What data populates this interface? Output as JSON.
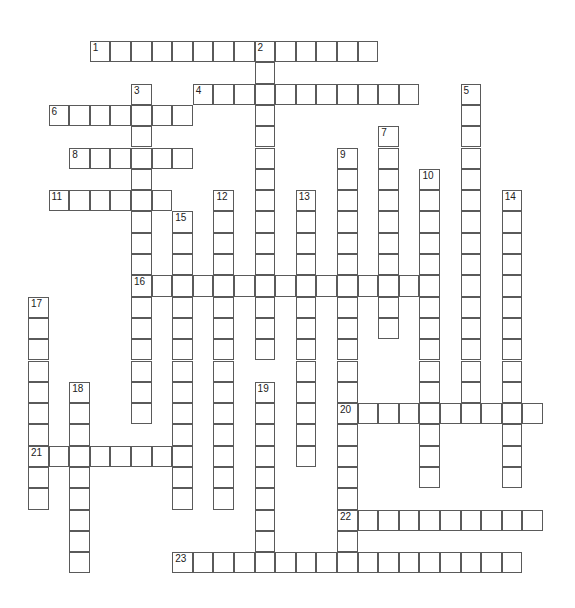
{
  "puzzle": {
    "grid_origin": {
      "x": 28,
      "y": 41
    },
    "cell_width": 20.6,
    "cell_height": 21.3,
    "line_color": "#5a5a5a",
    "words": [
      {
        "number": "1",
        "direction": "across",
        "row": 0,
        "col": 3,
        "length": 14
      },
      {
        "number": "2",
        "direction": "down",
        "row": 0,
        "col": 11,
        "length": 15
      },
      {
        "number": "3",
        "direction": "down",
        "row": 2,
        "col": 5,
        "length": 16
      },
      {
        "number": "4",
        "direction": "across",
        "row": 2,
        "col": 8,
        "length": 11
      },
      {
        "number": "5",
        "direction": "down",
        "row": 2,
        "col": 21,
        "length": 16
      },
      {
        "number": "6",
        "direction": "across",
        "row": 3,
        "col": 1,
        "length": 7
      },
      {
        "number": "7",
        "direction": "down",
        "row": 4,
        "col": 17,
        "length": 10
      },
      {
        "number": "8",
        "direction": "across",
        "row": 5,
        "col": 2,
        "length": 6
      },
      {
        "number": "9",
        "direction": "down",
        "row": 5,
        "col": 15,
        "length": 20
      },
      {
        "number": "10",
        "direction": "down",
        "row": 6,
        "col": 19,
        "length": 15
      },
      {
        "number": "11",
        "direction": "across",
        "row": 7,
        "col": 1,
        "length": 6
      },
      {
        "number": "12",
        "direction": "down",
        "row": 7,
        "col": 9,
        "length": 15
      },
      {
        "number": "13",
        "direction": "down",
        "row": 7,
        "col": 13,
        "length": 13
      },
      {
        "number": "14",
        "direction": "down",
        "row": 7,
        "col": 23,
        "length": 14
      },
      {
        "number": "15",
        "direction": "down",
        "row": 8,
        "col": 7,
        "length": 14
      },
      {
        "number": "16",
        "direction": "across",
        "row": 11,
        "col": 5,
        "length": 15
      },
      {
        "number": "17",
        "direction": "down",
        "row": 12,
        "col": 0,
        "length": 10
      },
      {
        "number": "18",
        "direction": "down",
        "row": 16,
        "col": 2,
        "length": 9
      },
      {
        "number": "19",
        "direction": "down",
        "row": 16,
        "col": 11,
        "length": 9
      },
      {
        "number": "20",
        "direction": "across",
        "row": 17,
        "col": 15,
        "length": 10
      },
      {
        "number": "21",
        "direction": "across",
        "row": 19,
        "col": 0,
        "length": 8
      },
      {
        "number": "22",
        "direction": "across",
        "row": 22,
        "col": 15,
        "length": 10
      },
      {
        "number": "23",
        "direction": "across",
        "row": 24,
        "col": 7,
        "length": 17
      }
    ]
  }
}
